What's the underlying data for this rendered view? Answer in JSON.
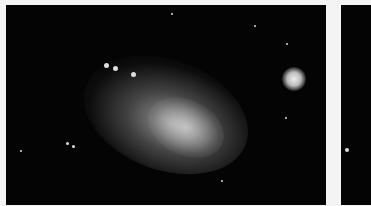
{
  "image": {
    "description": "Astronomical photograph of an irregular dwarf galaxy (Small Magellanic Cloud-like) with a bright globular cluster to the right, on black starfield",
    "panels": [
      {
        "name": "left-photo",
        "subject": "irregular galaxy with nearby globular cluster"
      },
      {
        "name": "right-photo",
        "subject": "partially visible starfield (cropped)"
      }
    ],
    "colors": {
      "background": "#f4f4f4",
      "sky": "#040404",
      "nebula": "#cfcfcf"
    }
  }
}
